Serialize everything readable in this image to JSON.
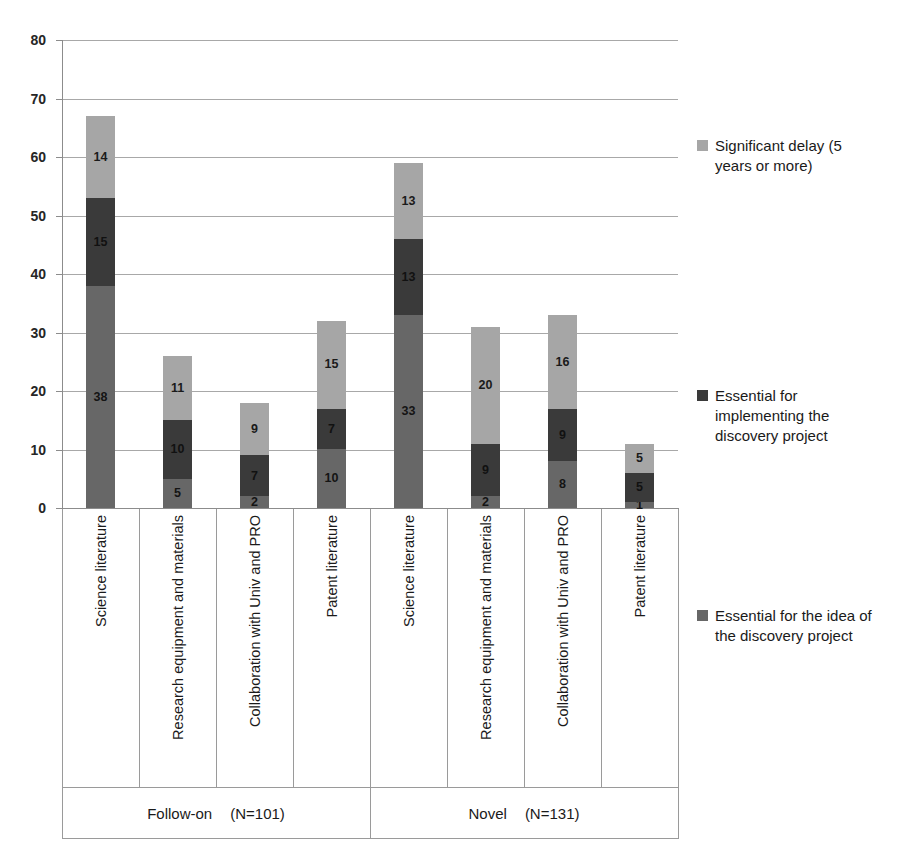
{
  "chart_data": {
    "type": "bar",
    "subtype": "stacked-bar",
    "title": "",
    "xlabel": "",
    "ylabel": "",
    "ylim": [
      0,
      80
    ],
    "yticks": [
      "0",
      "10",
      "20",
      "30",
      "40",
      "50",
      "60",
      "70",
      "80"
    ],
    "grid": true,
    "legend_position": "right",
    "categories": [
      "Science literature",
      "Research equipment and materials",
      "Collaboration with Univ and PRO",
      "Patent literature",
      "Science literature",
      "Research equipment and materials",
      "Collaboration with Univ and PRO",
      "Patent literature"
    ],
    "groups": [
      {
        "name": "Follow-on",
        "n_label": "(N=101)",
        "span": [
          0,
          3
        ]
      },
      {
        "name": "Novel",
        "n_label": "(N=131)",
        "span": [
          4,
          7
        ]
      }
    ],
    "series": [
      {
        "name": "Essential for the idea of the discovery project",
        "color": "#676767",
        "values": [
          38,
          5,
          2,
          10,
          33,
          2,
          8,
          1
        ]
      },
      {
        "name": "Essential for implementing the discovery project",
        "color": "#3a3a3a",
        "values": [
          15,
          10,
          7,
          7,
          13,
          9,
          9,
          5
        ]
      },
      {
        "name": "Significant delay (5 years or more)",
        "color": "#a6a6a6",
        "values": [
          14,
          11,
          9,
          15,
          13,
          20,
          16,
          5
        ]
      }
    ],
    "bar_totals": [
      67,
      26,
      18,
      32,
      59,
      31,
      33,
      11
    ]
  },
  "legend": {
    "items": [
      {
        "label_line1": "Significant delay (5",
        "label_line2": "years or more)",
        "color": "#a6a6a6"
      },
      {
        "label_line1": "Essential for",
        "label_line2": "implementing the",
        "label_line3": "discovery project",
        "color": "#3a3a3a"
      },
      {
        "label_line1": "Essential for the idea of",
        "label_line2": "the discovery project",
        "color": "#676767"
      }
    ]
  },
  "axis": {
    "y_ticks": [
      "80",
      "70",
      "60",
      "50",
      "40",
      "30",
      "20",
      "10",
      "0"
    ]
  },
  "colors": {
    "light_gray": "#a6a6a6",
    "dark_gray": "#3a3a3a",
    "mid_gray": "#676767",
    "grid": "#a8a8a8",
    "axis": "#8c8c8c",
    "text": "#1a1a1a",
    "background": "#ffffff"
  }
}
